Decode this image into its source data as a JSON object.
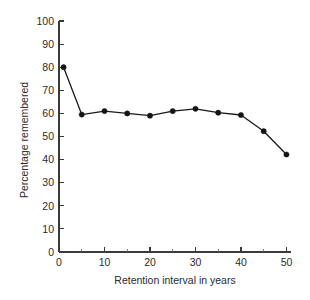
{
  "chart_data": {
    "type": "line",
    "title": "",
    "subtitle": "",
    "xlabel": "Retention interval in years",
    "ylabel": "Percentage remembered",
    "xlim": [
      0,
      51
    ],
    "ylim": [
      0,
      100
    ],
    "grid": false,
    "legend": "none",
    "x": [
      1,
      5,
      10,
      15,
      20,
      25,
      30,
      35,
      40,
      45,
      50
    ],
    "values": [
      80,
      59.5,
      61,
      60,
      59,
      61,
      62,
      60.3,
      59.3,
      52.3,
      42.2
    ],
    "series": [
      {
        "name": "Percentage remembered",
        "x": [
          1,
          5,
          10,
          15,
          20,
          25,
          30,
          35,
          40,
          45,
          50
        ],
        "values": [
          80,
          59.5,
          61,
          60,
          59,
          61,
          62,
          60.3,
          59.3,
          52.3,
          42.2
        ],
        "marker": "filled-circle",
        "color": "#141414"
      }
    ],
    "xticks": [
      0,
      10,
      20,
      30,
      40,
      50
    ],
    "xtick_labels": [
      "0",
      "10",
      "20",
      "30",
      "40",
      "50"
    ],
    "xticks_minor": [
      5,
      15,
      25,
      35,
      45
    ],
    "yticks": [
      0,
      10,
      20,
      30,
      40,
      50,
      60,
      70,
      80,
      90,
      100
    ],
    "ytick_labels": [
      "0",
      "10",
      "20",
      "30",
      "40",
      "50",
      "60",
      "70",
      "80",
      "90",
      "100"
    ],
    "annotations": []
  },
  "axis_titles": {
    "x": "Retention interval in years",
    "y": "Percentage remembered"
  },
  "colors": {
    "line": "#141414",
    "marker": "#141414",
    "axis": "#3a3a3a",
    "text": "#2b2b2b",
    "background": "#ffffff"
  }
}
